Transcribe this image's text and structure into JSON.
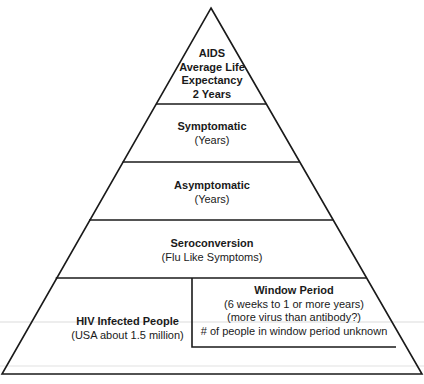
{
  "diagram": {
    "type": "pyramid",
    "colors": {
      "line": "#1a1a1a",
      "background": "#ffffff",
      "scan_artifact": "#d8d8d8"
    },
    "tiers": [
      {
        "id": "aids",
        "title_lines": [
          "AIDS",
          "Average Life",
          "Expectancy",
          "2 Years"
        ]
      },
      {
        "id": "symptomatic",
        "title": "Symptomatic",
        "subtitle": "(Years)"
      },
      {
        "id": "asymptomatic",
        "title": "Asymptomatic",
        "subtitle": "(Years)"
      },
      {
        "id": "seroconversion",
        "title": "Seroconversion",
        "subtitle": "(Flu Like Symptoms)"
      },
      {
        "id": "hiv-infected",
        "title": "HIV Infected People",
        "subtitle": "(USA about 1.5 million)"
      }
    ],
    "window_period": {
      "title": "Window Period",
      "lines": [
        "(6 weeks to 1 or more years)",
        "(more virus than antibody?)",
        "# of people in window period unknown"
      ]
    }
  }
}
